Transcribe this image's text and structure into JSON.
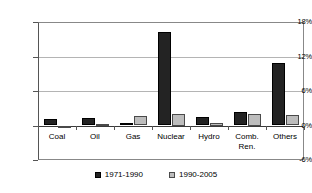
{
  "chart_data": {
    "type": "bar",
    "title": "",
    "subtitle": "",
    "xlabel": "",
    "ylabel": "",
    "categories": [
      "Coal",
      "Oil",
      "Gas",
      "Nuclear",
      "Hydro",
      "Comb.\nRen.",
      "Others"
    ],
    "series": [
      {
        "name": "1971-1990",
        "color": "#232323",
        "values": [
          1.2,
          1.3,
          0.4,
          16.3,
          1.4,
          2.4,
          10.8
        ]
      },
      {
        "name": "1990-2005",
        "color": "#bdbdbd",
        "values": [
          -0.2,
          0.2,
          1.6,
          2.0,
          0.5,
          2.0,
          1.8
        ]
      }
    ],
    "ylim": [
      -6,
      18
    ],
    "yticks": [
      18,
      12,
      6,
      0,
      -6
    ],
    "ytick_labels": [
      "18%",
      "12%",
      "6%",
      "0%",
      "-6%"
    ],
    "grid": true,
    "grid_axis": "y",
    "legend_position": "bottom"
  },
  "legend": {
    "items": [
      {
        "label": "1971-1990"
      },
      {
        "label": "1990-2005"
      }
    ]
  }
}
